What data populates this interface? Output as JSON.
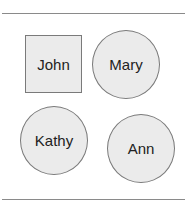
{
  "diagram": {
    "nodes": [
      {
        "label": "John",
        "shape": "square"
      },
      {
        "label": "Mary",
        "shape": "circle"
      },
      {
        "label": "Kathy",
        "shape": "circle"
      },
      {
        "label": "Ann",
        "shape": "circle"
      }
    ]
  },
  "colors": {
    "fill": "#ebebeb",
    "stroke": "#7a7a7a",
    "rule": "#8a8a8a"
  }
}
